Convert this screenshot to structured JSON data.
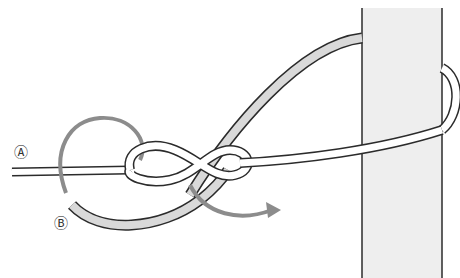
{
  "diagram": {
    "type": "knot-tying illustration",
    "labels": {
      "a": "Ⓐ",
      "b": "Ⓑ"
    },
    "colors": {
      "outline": "#2b2b2b",
      "rope_fill_light": "#ffffff",
      "rope_fill_gray": "#d9d9d9",
      "post_fill": "#eeeeee",
      "arrow": "#8c8c8c"
    }
  }
}
